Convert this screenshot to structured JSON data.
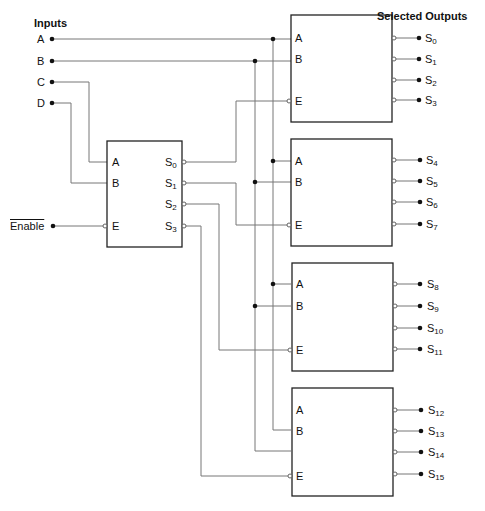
{
  "titles": {
    "inputs": "Inputs",
    "outputs": "Selected Outputs"
  },
  "inputs": [
    {
      "label": "A"
    },
    {
      "label": "B"
    },
    {
      "label": "C"
    },
    {
      "label": "D"
    },
    {
      "label": "Enable"
    }
  ],
  "decoder": {
    "inputs": [
      "A",
      "B",
      "E"
    ],
    "outputs": [
      {
        "base": "S",
        "sub": "0"
      },
      {
        "base": "S",
        "sub": "1"
      },
      {
        "base": "S",
        "sub": "2"
      },
      {
        "base": "S",
        "sub": "3"
      }
    ]
  },
  "blocks": [
    {
      "inputs": [
        "A",
        "B",
        "E"
      ],
      "outputs": [
        {
          "base": "S",
          "sub": "0"
        },
        {
          "base": "S",
          "sub": "1"
        },
        {
          "base": "S",
          "sub": "2"
        },
        {
          "base": "S",
          "sub": "3"
        }
      ]
    },
    {
      "inputs": [
        "A",
        "B",
        "E"
      ],
      "outputs": [
        {
          "base": "S",
          "sub": "4"
        },
        {
          "base": "S",
          "sub": "5"
        },
        {
          "base": "S",
          "sub": "6"
        },
        {
          "base": "S",
          "sub": "7"
        }
      ]
    },
    {
      "inputs": [
        "A",
        "B",
        "E"
      ],
      "outputs": [
        {
          "base": "S",
          "sub": "8"
        },
        {
          "base": "S",
          "sub": "9"
        },
        {
          "base": "S",
          "sub": "10"
        },
        {
          "base": "S",
          "sub": "11"
        }
      ]
    },
    {
      "inputs": [
        "A",
        "B",
        "E"
      ],
      "outputs": [
        {
          "base": "S",
          "sub": "12"
        },
        {
          "base": "S",
          "sub": "13"
        },
        {
          "base": "S",
          "sub": "14"
        },
        {
          "base": "S",
          "sub": "15"
        }
      ]
    }
  ],
  "colors": {
    "wire": "#777777",
    "box": "#222222",
    "dot": "#111111"
  }
}
